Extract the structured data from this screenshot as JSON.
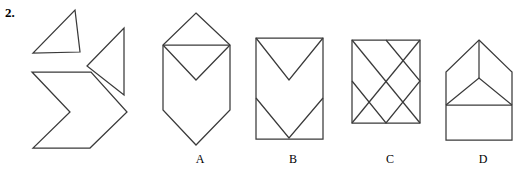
{
  "question": {
    "number": "2."
  },
  "colors": {
    "stroke": "#3a3a3a",
    "background": "#ffffff"
  },
  "prompt_pieces": [
    {
      "name": "right-triangle-piece",
      "points": "75,10 80,52 33,53"
    },
    {
      "name": "left-pointing-triangle-piece",
      "points": "87,66 124,28 124,95"
    },
    {
      "name": "chevron-arrow-piece",
      "points": "32,72 91,72 127,112 90,148 33,148 70,112"
    }
  ],
  "options": [
    {
      "key": "A",
      "label": "A",
      "label_x": 190,
      "label_y": 152,
      "name": "option-a-shape",
      "outline": "196,13 230,45 230,110 196,145 163,110 163,45",
      "inner": [
        {
          "name": "horizontal-divider",
          "points": "163,45 230,45"
        },
        {
          "name": "inner-v",
          "points": "163,45 196,80 230,45"
        }
      ]
    },
    {
      "key": "B",
      "label": "B",
      "label_x": 283,
      "label_y": 152,
      "name": "option-b-shape",
      "outline": "256,38 323,38 323,139 256,139",
      "inner": [
        {
          "name": "upper-v",
          "points": "256,38 289,80 323,38"
        },
        {
          "name": "lower-v",
          "points": "256,98 289,138 323,98"
        }
      ]
    },
    {
      "key": "C",
      "label": "C",
      "label_x": 380,
      "label_y": 152,
      "name": "option-c-shape",
      "outline": "352,40 420,40 420,123 352,123",
      "inner": [
        {
          "name": "diamond",
          "points": "386,40 420,81 386,123 352,81"
        },
        {
          "name": "diagonal-top-left",
          "points": "352,40 420,123"
        },
        {
          "name": "diagonal-bottom-left",
          "points": "352,123 420,40"
        }
      ]
    },
    {
      "key": "D",
      "label": "D",
      "label_x": 473,
      "label_y": 152,
      "name": "option-d-shape",
      "outline": "479,40 512,72 512,140 446,140 446,72",
      "inner": [
        {
          "name": "horizontal-divider",
          "points": "446,105 512,105"
        },
        {
          "name": "inner-roof-triangle",
          "points": "446,105 479,78 512,105"
        },
        {
          "name": "center-vertical",
          "points": "479,40 479,78"
        }
      ]
    }
  ]
}
